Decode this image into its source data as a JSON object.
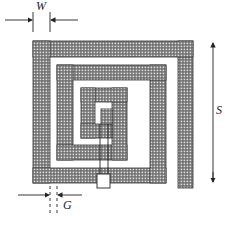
{
  "diagram": {
    "type": "square spiral inductor layout",
    "labels": {
      "width": "W",
      "gap": "G",
      "size": "S"
    },
    "colors": {
      "trace_fill": "#6e6e6e",
      "trace_dot": "#d8d8d8",
      "outline": "#333333",
      "background": "#ffffff"
    }
  }
}
